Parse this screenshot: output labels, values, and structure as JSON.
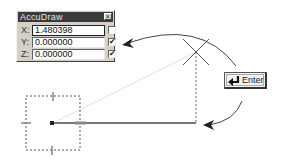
{
  "palette": {
    "title": "AccuDraw",
    "close_label": "×",
    "rows": [
      {
        "axis": "X:",
        "value": "1.480398",
        "checked": false,
        "check_glyph": ""
      },
      {
        "axis": "Y:",
        "value": "0.000000",
        "checked": true,
        "check_glyph": "✔"
      },
      {
        "axis": "Z:",
        "value": "0.000000",
        "checked": true,
        "check_glyph": "✔"
      }
    ]
  },
  "enter_key": {
    "label": "Enter",
    "icon": "return-arrow-icon"
  },
  "colors": {
    "line": "#555555",
    "dotted": "#777777",
    "rubber_band": "#e0e0e0",
    "palette_bg": "#d4d0c8",
    "titlebar_bg": "#3a3a3a"
  }
}
